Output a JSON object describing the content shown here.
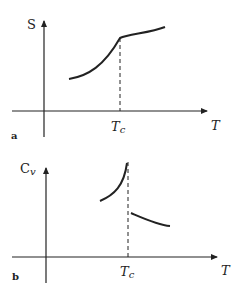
{
  "panels": [
    {
      "id": "a",
      "panel_label": "a",
      "y_label": "S",
      "x_label": "T",
      "critical_label_main": "T",
      "critical_label_sub": "c",
      "description": "Entropy S vs temperature T, continuous with a kink at Tc"
    },
    {
      "id": "b",
      "panel_label": "b",
      "y_label_main": "C",
      "y_label_sub": "v",
      "x_label": "T",
      "critical_label_main": "T",
      "critical_label_sub": "c",
      "description": "Heat capacity Cv vs temperature T, divergent peak with discontinuous jump at Tc"
    }
  ],
  "colors": {
    "stroke": "#222222",
    "background": "#ffffff"
  }
}
